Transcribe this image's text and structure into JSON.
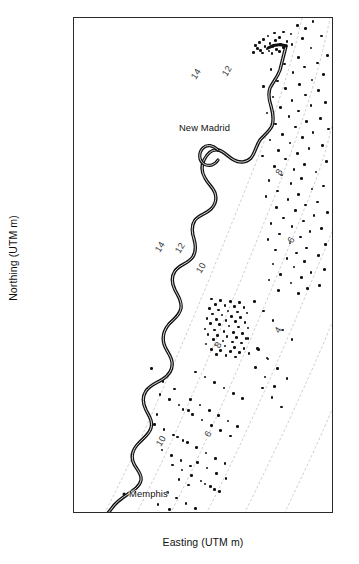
{
  "chart_data": {
    "type": "scatter",
    "title": "",
    "xlabel": "Easting (UTM m)",
    "ylabel": "Northing (UTM m)",
    "xlim": [
      748000,
      872000
    ],
    "ylim": [
      3876000,
      4108000
    ],
    "xticks": [
      760000,
      780000,
      800000,
      820000,
      840000,
      860000
    ],
    "xticklabels": [
      "760000",
      "780000",
      "800000",
      "820000",
      "840000",
      "860000"
    ],
    "yticks": [
      3880000,
      3900000,
      3920000,
      3940000,
      3960000,
      3980000,
      4000000,
      4020000,
      4040000,
      4060000,
      4080000,
      4100000
    ],
    "yticklabels": [
      "3880000",
      "3900000",
      "3920000",
      "3940000",
      "3960000",
      "3980000",
      "4000000",
      "4020000",
      "4040000",
      "4060000",
      "4080000",
      "4100000"
    ],
    "grid": false,
    "legend": null,
    "series": [
      {
        "name": "earthquake epicenters",
        "marker": "filled-circle",
        "color": "#111111",
        "points": [
          [
            862000,
            4106500
          ],
          [
            854500,
            4104500
          ],
          [
            858500,
            4103000
          ],
          [
            848000,
            4101500
          ],
          [
            843500,
            4101000
          ],
          [
            851500,
            4100500
          ],
          [
            840500,
            4099500
          ],
          [
            846000,
            4099000
          ],
          [
            857000,
            4098500
          ],
          [
            838500,
            4098000
          ],
          [
            844000,
            4097500
          ],
          [
            849500,
            4097000
          ],
          [
            836500,
            4096500
          ],
          [
            841500,
            4096000
          ],
          [
            846500,
            4095800
          ],
          [
            852000,
            4095500
          ],
          [
            834500,
            4095000
          ],
          [
            839000,
            4094800
          ],
          [
            843000,
            4094500
          ],
          [
            848000,
            4094200
          ],
          [
            835500,
            4093800
          ],
          [
            840000,
            4093500
          ],
          [
            844500,
            4093200
          ],
          [
            837000,
            4092800
          ],
          [
            841000,
            4092500
          ],
          [
            846000,
            4092200
          ],
          [
            833500,
            4092000
          ],
          [
            838000,
            4091700
          ],
          [
            842500,
            4091400
          ],
          [
            866000,
            4099500
          ],
          [
            861000,
            4094000
          ],
          [
            869000,
            4090500
          ],
          [
            855000,
            4089500
          ],
          [
            864000,
            4087000
          ],
          [
            848500,
            4086500
          ],
          [
            858000,
            4085000
          ],
          [
            842000,
            4084000
          ],
          [
            852500,
            4082500
          ],
          [
            867000,
            4081500
          ],
          [
            861500,
            4079000
          ],
          [
            845000,
            4078500
          ],
          [
            855500,
            4077000
          ],
          [
            838500,
            4076000
          ],
          [
            849000,
            4075000
          ],
          [
            864500,
            4074000
          ],
          [
            858500,
            4072000
          ],
          [
            843000,
            4071000
          ],
          [
            852000,
            4069500
          ],
          [
            868000,
            4068500
          ],
          [
            861000,
            4067000
          ],
          [
            846500,
            4066000
          ],
          [
            855000,
            4064500
          ],
          [
            840000,
            4063500
          ],
          [
            850500,
            4062000
          ],
          [
            865500,
            4061000
          ],
          [
            859000,
            4059500
          ],
          [
            844000,
            4058500
          ],
          [
            853500,
            4057000
          ],
          [
            869500,
            4056000
          ],
          [
            862000,
            4054500
          ],
          [
            847500,
            4053500
          ],
          [
            857000,
            4052000
          ],
          [
            841500,
            4051000
          ],
          [
            851000,
            4049500
          ],
          [
            866500,
            4048500
          ],
          [
            860000,
            4047000
          ],
          [
            845500,
            4046000
          ],
          [
            854500,
            4044500
          ],
          [
            838000,
            4043500
          ],
          [
            849000,
            4042000
          ],
          [
            868500,
            4041000
          ],
          [
            858000,
            4039500
          ],
          [
            843500,
            4038500
          ],
          [
            853000,
            4037000
          ],
          [
            863500,
            4036000
          ],
          [
            847000,
            4034500
          ],
          [
            856500,
            4033000
          ],
          [
            841000,
            4032000
          ],
          [
            851500,
            4030500
          ],
          [
            867000,
            4029500
          ],
          [
            861500,
            4028000
          ],
          [
            845000,
            4027000
          ],
          [
            855000,
            4025500
          ],
          [
            839500,
            4024500
          ],
          [
            850000,
            4023000
          ],
          [
            864000,
            4022000
          ],
          [
            858500,
            4020500
          ],
          [
            844500,
            4019500
          ],
          [
            853500,
            4018000
          ],
          [
            869000,
            4017000
          ],
          [
            862500,
            4015500
          ],
          [
            848000,
            4014500
          ],
          [
            857500,
            4013000
          ],
          [
            842000,
            4012000
          ],
          [
            852000,
            4010500
          ],
          [
            866000,
            4009500
          ],
          [
            860500,
            4008000
          ],
          [
            846000,
            4007000
          ],
          [
            856000,
            4005500
          ],
          [
            840500,
            4004500
          ],
          [
            851000,
            4003000
          ],
          [
            868000,
            4002000
          ],
          [
            859000,
            4000500
          ],
          [
            844000,
            3999500
          ],
          [
            854000,
            3998000
          ],
          [
            864500,
            3997000
          ],
          [
            849500,
            3995500
          ],
          [
            858000,
            3994000
          ],
          [
            843000,
            3993000
          ],
          [
            853000,
            3991500
          ],
          [
            867500,
            3990500
          ],
          [
            861000,
            3989000
          ],
          [
            846500,
            3988000
          ],
          [
            856500,
            3986500
          ],
          [
            841000,
            3985500
          ],
          [
            851500,
            3984000
          ],
          [
            865000,
            3983000
          ],
          [
            859500,
            3981500
          ],
          [
            845500,
            3980500
          ],
          [
            855000,
            3979000
          ],
          [
            813500,
            3976500
          ],
          [
            818000,
            3976000
          ],
          [
            822500,
            3975500
          ],
          [
            827000,
            3975000
          ],
          [
            815500,
            3974000
          ],
          [
            820000,
            3973500
          ],
          [
            824500,
            3973000
          ],
          [
            829000,
            3972500
          ],
          [
            812500,
            3972000
          ],
          [
            817000,
            3971500
          ],
          [
            821500,
            3971000
          ],
          [
            826000,
            3970500
          ],
          [
            830500,
            3970000
          ],
          [
            814000,
            3969500
          ],
          [
            818500,
            3969000
          ],
          [
            823000,
            3968500
          ],
          [
            827500,
            3968000
          ],
          [
            811500,
            3967500
          ],
          [
            816000,
            3967000
          ],
          [
            820500,
            3966500
          ],
          [
            825000,
            3966000
          ],
          [
            829500,
            3965500
          ],
          [
            813000,
            3965000
          ],
          [
            817500,
            3964500
          ],
          [
            822000,
            3964000
          ],
          [
            826500,
            3963500
          ],
          [
            831000,
            3963000
          ],
          [
            810500,
            3962500
          ],
          [
            815000,
            3962000
          ],
          [
            819500,
            3961500
          ],
          [
            824000,
            3961000
          ],
          [
            828500,
            3960500
          ],
          [
            812000,
            3960000
          ],
          [
            816500,
            3959500
          ],
          [
            821000,
            3959000
          ],
          [
            825500,
            3958500
          ],
          [
            830000,
            3958000
          ],
          [
            814500,
            3957500
          ],
          [
            819000,
            3957000
          ],
          [
            823500,
            3956500
          ],
          [
            828000,
            3956000
          ],
          [
            811000,
            3955500
          ],
          [
            815500,
            3955000
          ],
          [
            820000,
            3954500
          ],
          [
            824500,
            3954000
          ],
          [
            829000,
            3953500
          ],
          [
            813500,
            3953000
          ],
          [
            818000,
            3952500
          ],
          [
            822500,
            3952000
          ],
          [
            827000,
            3951500
          ],
          [
            831500,
            3951000
          ],
          [
            816000,
            3950500
          ],
          [
            820500,
            3950000
          ],
          [
            825000,
            3949500
          ],
          [
            834000,
            3975500
          ],
          [
            838500,
            3971000
          ],
          [
            843000,
            3966500
          ],
          [
            847500,
            3962000
          ],
          [
            852000,
            3957500
          ],
          [
            836000,
            3953000
          ],
          [
            840500,
            3948500
          ],
          [
            845000,
            3944000
          ],
          [
            849500,
            3939500
          ],
          [
            838000,
            3935000
          ],
          [
            842500,
            3930500
          ],
          [
            847000,
            3926000
          ],
          [
            834500,
            3944500
          ],
          [
            839000,
            3940000
          ],
          [
            843500,
            3935500
          ],
          [
            831000,
            3958000
          ],
          [
            835500,
            3953500
          ],
          [
            840000,
            3949000
          ],
          [
            806000,
            3942500
          ],
          [
            810500,
            3940000
          ],
          [
            815000,
            3937500
          ],
          [
            819500,
            3935000
          ],
          [
            824000,
            3932500
          ],
          [
            828500,
            3930000
          ],
          [
            803500,
            3929500
          ],
          [
            808000,
            3927000
          ],
          [
            812500,
            3924500
          ],
          [
            817000,
            3922000
          ],
          [
            821500,
            3919500
          ],
          [
            826000,
            3917000
          ],
          [
            800000,
            3925000
          ],
          [
            804500,
            3922500
          ],
          [
            809000,
            3920000
          ],
          [
            813500,
            3917500
          ],
          [
            818000,
            3915000
          ],
          [
            822500,
            3912500
          ],
          [
            797500,
            3912000
          ],
          [
            802000,
            3909500
          ],
          [
            806500,
            3907000
          ],
          [
            811000,
            3904500
          ],
          [
            815500,
            3902000
          ],
          [
            820000,
            3899500
          ],
          [
            795000,
            3899000
          ],
          [
            799500,
            3896500
          ],
          [
            804000,
            3894000
          ],
          [
            808500,
            3891500
          ],
          [
            813000,
            3889000
          ],
          [
            817500,
            3886500
          ],
          [
            792500,
            3886000
          ],
          [
            797000,
            3883500
          ],
          [
            801500,
            3881000
          ],
          [
            806000,
            3878500
          ],
          [
            810500,
            3890000
          ],
          [
            815000,
            3887500
          ],
          [
            788000,
            3880500
          ],
          [
            793500,
            3878000
          ],
          [
            798000,
            3892000
          ],
          [
            802500,
            3889500
          ],
          [
            807000,
            3900000
          ],
          [
            811500,
            3897500
          ],
          [
            816000,
            3895000
          ],
          [
            820500,
            3892500
          ],
          [
            790000,
            3906000
          ],
          [
            794500,
            3903500
          ],
          [
            799000,
            3901000
          ],
          [
            803500,
            3898500
          ],
          [
            786500,
            3918000
          ],
          [
            791000,
            3915500
          ],
          [
            795500,
            3913000
          ],
          [
            800000,
            3910500
          ],
          [
            789000,
            3932000
          ],
          [
            793500,
            3929500
          ],
          [
            798000,
            3927000
          ],
          [
            802500,
            3924500
          ],
          [
            785000,
            3944000
          ],
          [
            790500,
            3938000
          ],
          [
            796000,
            3934500
          ],
          [
            787500,
            3922500
          ]
        ]
      }
    ],
    "annotations": [
      {
        "label": "New Madrid",
        "type": "city",
        "x": 812500,
        "y": 4053000
      },
      {
        "label": "Memphis",
        "type": "city",
        "x": 792000,
        "y": 3885500
      }
    ],
    "contours": {
      "name": "depth-to-basement contours",
      "unit": "km",
      "levels": [
        "14",
        "12",
        "10",
        "8",
        "6",
        "4"
      ],
      "style": "dashed-light-gray",
      "labels": [
        {
          "level": "14",
          "x": 806000,
          "y": 4082000
        },
        {
          "level": "12",
          "x": 821000,
          "y": 4083000
        },
        {
          "level": "14",
          "x": 789000,
          "y": 4001000
        },
        {
          "level": "12",
          "x": 798500,
          "y": 4000500
        },
        {
          "level": "10",
          "x": 808500,
          "y": 3991000
        },
        {
          "level": "8",
          "x": 846000,
          "y": 4036000
        },
        {
          "level": "6",
          "x": 851500,
          "y": 4004000
        },
        {
          "level": "8",
          "x": 816500,
          "y": 3955000
        },
        {
          "level": "4",
          "x": 845500,
          "y": 3962000
        },
        {
          "level": "10",
          "x": 789500,
          "y": 3910000
        },
        {
          "level": "6",
          "x": 812000,
          "y": 3913500
        }
      ]
    },
    "river": {
      "name": "Mississippi River",
      "style": "thick-black-outline"
    }
  },
  "figure": {
    "axis_title_x": "Easting (UTM m)",
    "axis_title_y": "Northing (UTM m)",
    "frame_color": "#2a2a2a",
    "point_color": "#111111",
    "contour_color": "#b9b9b9",
    "river_color": "#111111",
    "background": "#ffffff"
  }
}
